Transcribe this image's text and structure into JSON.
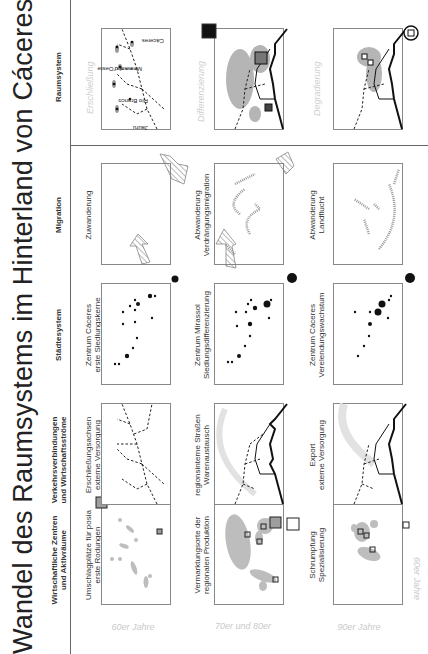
{
  "title": "Wandel des Raumsystems im Hinterland von Cáceres",
  "columns": [
    {
      "key": "wirtschaft",
      "label_line1": "Wirtschaftliche Zentren",
      "label_line2": "und Aktivräume"
    },
    {
      "key": "verkehr",
      "label_line1": "Verkehrsverbindungen",
      "label_line2": "und Wirtschaftsströme"
    },
    {
      "key": "staedte",
      "label_line1": "Städtesystem",
      "label_line2": ""
    },
    {
      "key": "migration",
      "label_line1": "Migration",
      "label_line2": ""
    },
    {
      "key": "raum",
      "label_line1": "Raumsystem",
      "label_line2": ""
    }
  ],
  "rows": [
    {
      "label": "60er Jahre",
      "wirtschaft": {
        "line1": "Umschlagplätze für posia",
        "line2": "erste Rodungen"
      },
      "verkehr": {
        "line1": "Erschließungsachsen",
        "line2": "externe Versorgung"
      },
      "staedte": {
        "line1": "Zentrum Cáceres",
        "line2": "erste Siedlungskerne"
      },
      "migration": {
        "line1": "Zuwanderung",
        "line2": ""
      },
      "raum": {
        "label": "Erschließung"
      }
    },
    {
      "label": "70er und 80er",
      "wirtschaft": {
        "line1": "Vermarktungsorte der",
        "line2": "regionalen Produktion"
      },
      "verkehr": {
        "line1": "regionsinterne Straßen",
        "line2": "Warenaustausch"
      },
      "staedte": {
        "line1": "Zentrum Mirassol",
        "line2": "Siedlungsdifferenzierung"
      },
      "migration": {
        "line1": "Abwanderung",
        "line2": "Verdrängungsmigration"
      },
      "raum": {
        "label": "Differenzierung"
      }
    },
    {
      "label": "90er Jahre",
      "wirtschaft": {
        "line1": "Schrumpfung",
        "line2": "Spezialisierung"
      },
      "verkehr": {
        "line1": "Export",
        "line2": "externe Versorgung"
      },
      "staedte": {
        "line1": "Zentrum Cáceres",
        "line2": "Verelendungswachstum"
      },
      "migration": {
        "line1": "Abwanderung",
        "line2": "Landflucht"
      },
      "raum": {
        "label": "Degradierung"
      }
    }
  ],
  "place_names": [
    "Jauru",
    "Rio Branco",
    "Mirassol d'Oeste",
    "Cáceres"
  ],
  "colors": {
    "panel_border": "#888888",
    "area_fill": "#bdbdbd",
    "flow_arrow": "#e2e2e2",
    "road_solid": "#111111",
    "label_faint": "#c9c9c9"
  }
}
